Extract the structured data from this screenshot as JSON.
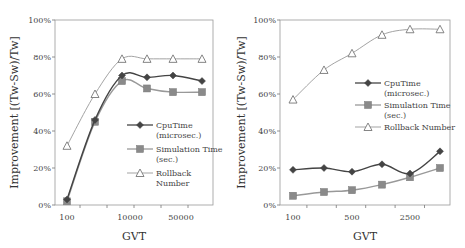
{
  "chart_data": [
    {
      "type": "line",
      "title": "",
      "xlabel": "GVT",
      "ylabel": "Improvement [(Tw-Sw)/Tw]",
      "x_tick_labels": [
        "100",
        "",
        "10000",
        "",
        "50000",
        ""
      ],
      "ylim": [
        0,
        100
      ],
      "y_ticks": [
        "0%",
        "20%",
        "40%",
        "60%",
        "80%",
        "100%"
      ],
      "legend": "center-right",
      "series": [
        {
          "name": "CpuTime (microsec.)",
          "marker": "diamond",
          "color": "#444444",
          "values": [
            3,
            46,
            70,
            69,
            70,
            67
          ]
        },
        {
          "name": "Simulation Time (sec.)",
          "marker": "square",
          "color": "#8a8a8a",
          "values": [
            2,
            45,
            67,
            63,
            61,
            61
          ]
        },
        {
          "name": "Rollback Number",
          "marker": "triangle",
          "color": "#8a8a8a",
          "values": [
            32,
            60,
            79,
            79,
            79,
            79
          ]
        }
      ],
      "legend_lines": [
        [
          "CpuTime",
          "(microsec.)"
        ],
        [
          "Simulation Time",
          "(sec.)"
        ],
        [
          "Rollback",
          "Number"
        ]
      ]
    },
    {
      "type": "line",
      "title": "",
      "xlabel": "GVT",
      "ylabel": "Improvement [(Tw-Sw)/Tw]",
      "x_tick_labels": [
        "100",
        "",
        "500",
        "",
        "2500",
        ""
      ],
      "ylim": [
        0,
        100
      ],
      "y_ticks": [
        "0%",
        "20%",
        "40%",
        "60%",
        "80%",
        "100%"
      ],
      "legend": "center-right",
      "series": [
        {
          "name": "CpuTime (microsec.)",
          "marker": "diamond",
          "color": "#444444",
          "values": [
            19,
            20,
            18,
            22,
            17,
            29
          ]
        },
        {
          "name": "Simulation Time (sec.)",
          "marker": "square",
          "color": "#8a8a8a",
          "values": [
            5,
            7,
            8,
            11,
            15,
            20
          ]
        },
        {
          "name": "Rollback Number",
          "marker": "triangle",
          "color": "#8a8a8a",
          "values": [
            57,
            73,
            82,
            92,
            95,
            95
          ]
        }
      ],
      "legend_lines": [
        [
          "CpuTime",
          "(microsec.)"
        ],
        [
          "Simulation Time",
          "(sec.)"
        ],
        [
          "Rollback Number"
        ]
      ]
    }
  ]
}
